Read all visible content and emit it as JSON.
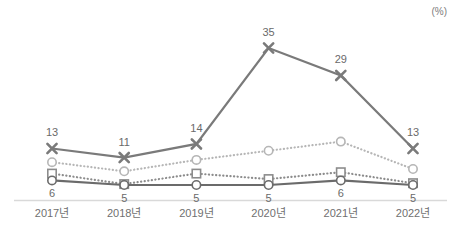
{
  "chart_data": {
    "type": "line",
    "title": "",
    "subtitle": "",
    "xlabel": "",
    "ylabel": "",
    "unit_label": "(%)",
    "grid": false,
    "legend_position": "none",
    "ylim": [
      0,
      38
    ],
    "categories": [
      "2017년",
      "2018년",
      "2019년",
      "2020년",
      "2021년",
      "2022년"
    ],
    "series": [
      {
        "name": "series-x-solid-dark",
        "marker": "x",
        "line_style": "solid",
        "color": "#7a7a7a",
        "values": [
          13,
          11,
          14,
          35,
          29,
          13
        ],
        "labels": [
          "13",
          "11",
          "14",
          "35",
          "29",
          "13"
        ],
        "label_position": "above"
      },
      {
        "name": "series-circle-light-dotted",
        "marker": "circle",
        "line_style": "dotted",
        "color": "#b6b6b6",
        "values": [
          10,
          8,
          10.5,
          12.5,
          14.5,
          8.5
        ],
        "labels": [
          "",
          "",
          "",
          "",
          "",
          ""
        ],
        "label_position": "none"
      },
      {
        "name": "series-square-dotted",
        "marker": "square",
        "line_style": "dotted",
        "color": "#8c8c8c",
        "values": [
          7.5,
          5.2,
          7.5,
          6.3,
          7.8,
          5.4
        ],
        "labels": [
          "",
          "",
          "",
          "",
          "",
          ""
        ],
        "label_position": "none"
      },
      {
        "name": "series-circle-solid-dark",
        "marker": "circle",
        "line_style": "solid",
        "color": "#6b6b6b",
        "values": [
          6,
          5,
          5,
          5,
          6,
          5
        ],
        "labels": [
          "6",
          "5",
          "5",
          "5",
          "6",
          "5"
        ],
        "label_position": "below"
      }
    ]
  },
  "axis": {
    "baseline_color": "#d9d9d9"
  }
}
